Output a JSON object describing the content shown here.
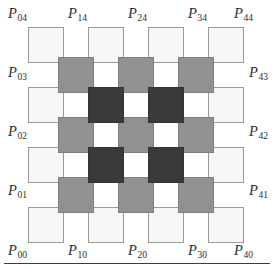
{
  "figure": {
    "name": "offset-square-lattice-diagram",
    "colors": {
      "light": "#f7f7f5",
      "light_border": "#9a9a9a",
      "gray": "#919191",
      "gray_border": "#7e7e7e",
      "dark": "#3a3a3a",
      "dark_border": "#343434",
      "label": "#2b2b2b",
      "rule": "#3c3c3c",
      "background": "#ffffff"
    },
    "geometry": {
      "square_size": 36,
      "pitch": 60,
      "half_pitch": 30,
      "origin_x": 28,
      "origin_y": 27
    },
    "squares": [
      {
        "id": "L-0-4",
        "shade": "light",
        "x": 28,
        "y": 27
      },
      {
        "id": "L-1-4",
        "shade": "light",
        "x": 88,
        "y": 27
      },
      {
        "id": "L-2-4",
        "shade": "light",
        "x": 148,
        "y": 27
      },
      {
        "id": "L-3-4",
        "shade": "light",
        "x": 208,
        "y": 27
      },
      {
        "id": "L-0-3",
        "shade": "light",
        "x": 28,
        "y": 87
      },
      {
        "id": "L-3-3",
        "shade": "light",
        "x": 208,
        "y": 87
      },
      {
        "id": "L-0-2",
        "shade": "light",
        "x": 28,
        "y": 147
      },
      {
        "id": "L-3-2",
        "shade": "light",
        "x": 208,
        "y": 147
      },
      {
        "id": "L-0-1",
        "shade": "light",
        "x": 28,
        "y": 207
      },
      {
        "id": "L-1-1",
        "shade": "light",
        "x": 88,
        "y": 207
      },
      {
        "id": "L-2-1",
        "shade": "light",
        "x": 148,
        "y": 207
      },
      {
        "id": "L-3-1",
        "shade": "light",
        "x": 208,
        "y": 207
      },
      {
        "id": "G-0-3",
        "shade": "gray",
        "x": 58,
        "y": 57
      },
      {
        "id": "G-1-3",
        "shade": "gray",
        "x": 118,
        "y": 57
      },
      {
        "id": "G-2-3",
        "shade": "gray",
        "x": 178,
        "y": 57
      },
      {
        "id": "G-0-2",
        "shade": "gray",
        "x": 58,
        "y": 117
      },
      {
        "id": "G-1-2",
        "shade": "gray",
        "x": 118,
        "y": 117
      },
      {
        "id": "G-2-2",
        "shade": "gray",
        "x": 178,
        "y": 117
      },
      {
        "id": "G-0-1",
        "shade": "gray",
        "x": 58,
        "y": 177
      },
      {
        "id": "G-1-1",
        "shade": "gray",
        "x": 118,
        "y": 177
      },
      {
        "id": "G-2-1",
        "shade": "gray",
        "x": 178,
        "y": 177
      },
      {
        "id": "D-0-1",
        "shade": "dark",
        "x": 88,
        "y": 87
      },
      {
        "id": "D-1-1",
        "shade": "dark",
        "x": 148,
        "y": 87
      },
      {
        "id": "D-0-0",
        "shade": "dark",
        "x": 88,
        "y": 147
      },
      {
        "id": "D-1-0",
        "shade": "dark",
        "x": 148,
        "y": 147
      }
    ],
    "labels": {
      "top": [
        {
          "id": "P04",
          "base": "P",
          "sub": "04",
          "x": 8,
          "y": 6
        },
        {
          "id": "P14",
          "base": "P",
          "sub": "14",
          "x": 68,
          "y": 6
        },
        {
          "id": "P24",
          "base": "P",
          "sub": "24",
          "x": 128,
          "y": 6
        },
        {
          "id": "P34",
          "base": "P",
          "sub": "34",
          "x": 188,
          "y": 6
        },
        {
          "id": "P44",
          "base": "P",
          "sub": "44",
          "x": 234,
          "y": 6
        }
      ],
      "left": [
        {
          "id": "P03",
          "base": "P",
          "sub": "03",
          "x": 8,
          "y": 65
        },
        {
          "id": "P02",
          "base": "P",
          "sub": "02",
          "x": 8,
          "y": 124
        },
        {
          "id": "P01",
          "base": "P",
          "sub": "01",
          "x": 8,
          "y": 183
        }
      ],
      "right": [
        {
          "id": "P43",
          "base": "P",
          "sub": "43",
          "x": 268,
          "y": 65
        },
        {
          "id": "P42",
          "base": "P",
          "sub": "42",
          "x": 268,
          "y": 124
        },
        {
          "id": "P41",
          "base": "P",
          "sub": "41",
          "x": 268,
          "y": 183
        }
      ],
      "bottom": [
        {
          "id": "P00",
          "base": "P",
          "sub": "00",
          "x": 8,
          "y": 243
        },
        {
          "id": "P10",
          "base": "P",
          "sub": "10",
          "x": 68,
          "y": 243
        },
        {
          "id": "P20",
          "base": "P",
          "sub": "20",
          "x": 128,
          "y": 243
        },
        {
          "id": "P30",
          "base": "P",
          "sub": "30",
          "x": 188,
          "y": 243
        },
        {
          "id": "P40",
          "base": "P",
          "sub": "40",
          "x": 234,
          "y": 243
        }
      ]
    },
    "rule": {
      "id": "bottom-rule",
      "y": 263
    }
  }
}
